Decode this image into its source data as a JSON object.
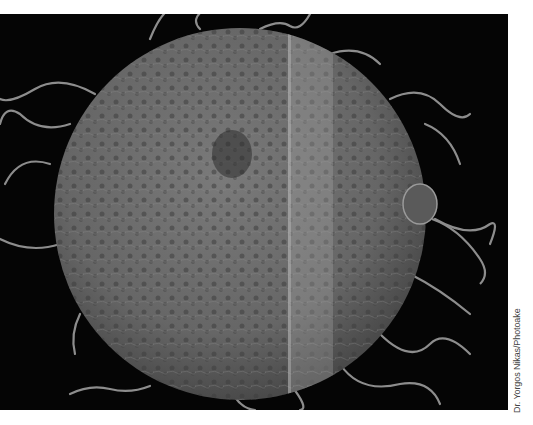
{
  "image": {
    "subject": "scanning electron micrograph of egg cell surrounded by sperm",
    "background_color": "#050505",
    "sphere_color": "#6d6d6d",
    "highlight_stripe_color": "#9a9a9a"
  },
  "credit": {
    "text": "Dr. Yorgos Nikas/Photoake"
  }
}
